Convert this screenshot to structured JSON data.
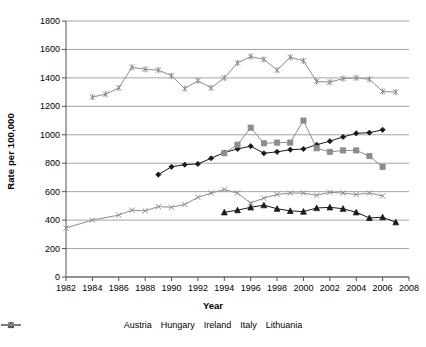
{
  "chart_data": {
    "type": "line",
    "title": "",
    "xlabel": "Year",
    "ylabel": "Rate per 100,000",
    "xlim": [
      1982,
      2008
    ],
    "ylim": [
      0,
      1800
    ],
    "ytick_step": 200,
    "xtick_step": 2,
    "grid": true,
    "legend_position": "bottom",
    "yticks": [
      "0",
      "200",
      "400",
      "600",
      "800",
      "1000",
      "1200",
      "1400",
      "1600",
      "1800"
    ],
    "xticks": [
      "1982",
      "1984",
      "1986",
      "1988",
      "1990",
      "1992",
      "1994",
      "1996",
      "1998",
      "2000",
      "2002",
      "2004",
      "2006",
      "2008"
    ],
    "series": [
      {
        "name": "Austria",
        "marker": "diamond",
        "color": "#1a1a1a",
        "points": [
          [
            1989,
            720
          ],
          [
            1990,
            775
          ],
          [
            1991,
            790
          ],
          [
            1992,
            795
          ],
          [
            1993,
            835
          ],
          [
            1994,
            875
          ],
          [
            1995,
            900
          ],
          [
            1996,
            920
          ],
          [
            1997,
            870
          ],
          [
            1998,
            880
          ],
          [
            1999,
            895
          ],
          [
            2000,
            900
          ],
          [
            2001,
            930
          ],
          [
            2002,
            955
          ],
          [
            2003,
            985
          ],
          [
            2004,
            1010
          ],
          [
            2005,
            1015
          ],
          [
            2006,
            1035
          ]
        ]
      },
      {
        "name": "Hungary",
        "marker": "square",
        "color": "#8c8c8c",
        "points": [
          [
            1994,
            870
          ],
          [
            1995,
            930
          ],
          [
            1996,
            1050
          ],
          [
            1997,
            940
          ],
          [
            1998,
            945
          ],
          [
            1999,
            945
          ],
          [
            2000,
            1100
          ],
          [
            2001,
            905
          ],
          [
            2002,
            880
          ],
          [
            2003,
            890
          ],
          [
            2004,
            890
          ],
          [
            2005,
            850
          ],
          [
            2006,
            775
          ]
        ]
      },
      {
        "name": "Ireland",
        "marker": "triangle",
        "color": "#1a1a1a",
        "points": [
          [
            1994,
            455
          ],
          [
            1995,
            470
          ],
          [
            1996,
            490
          ],
          [
            1997,
            505
          ],
          [
            1998,
            480
          ],
          [
            1999,
            465
          ],
          [
            2000,
            460
          ],
          [
            2001,
            485
          ],
          [
            2002,
            490
          ],
          [
            2003,
            480
          ],
          [
            2004,
            455
          ],
          [
            2005,
            415
          ],
          [
            2006,
            420
          ],
          [
            2007,
            385
          ]
        ]
      },
      {
        "name": "Italy",
        "marker": "cross",
        "color": "#8c8c8c",
        "points": [
          [
            1982,
            345
          ],
          [
            1984,
            400
          ],
          [
            1986,
            435
          ],
          [
            1987,
            470
          ],
          [
            1988,
            465
          ],
          [
            1989,
            495
          ],
          [
            1990,
            490
          ],
          [
            1991,
            510
          ],
          [
            1992,
            560
          ],
          [
            1993,
            590
          ],
          [
            1994,
            615
          ],
          [
            1995,
            590
          ],
          [
            1996,
            520
          ],
          [
            1997,
            555
          ],
          [
            1998,
            580
          ],
          [
            1999,
            590
          ],
          [
            2000,
            590
          ],
          [
            2001,
            575
          ],
          [
            2002,
            595
          ],
          [
            2003,
            590
          ],
          [
            2004,
            580
          ],
          [
            2005,
            590
          ],
          [
            2006,
            570
          ]
        ]
      },
      {
        "name": "Lithuania",
        "marker": "asterisk",
        "color": "#8c8c8c",
        "points": [
          [
            1984,
            1265
          ],
          [
            1985,
            1285
          ],
          [
            1986,
            1330
          ],
          [
            1987,
            1475
          ],
          [
            1988,
            1460
          ],
          [
            1989,
            1455
          ],
          [
            1990,
            1415
          ],
          [
            1991,
            1325
          ],
          [
            1992,
            1380
          ],
          [
            1993,
            1330
          ],
          [
            1994,
            1400
          ],
          [
            1995,
            1505
          ],
          [
            1996,
            1550
          ],
          [
            1997,
            1530
          ],
          [
            1998,
            1455
          ],
          [
            1999,
            1545
          ],
          [
            2000,
            1520
          ],
          [
            2001,
            1375
          ],
          [
            2002,
            1370
          ],
          [
            2003,
            1395
          ],
          [
            2004,
            1400
          ],
          [
            2005,
            1390
          ],
          [
            2006,
            1305
          ],
          [
            2007,
            1300
          ]
        ]
      }
    ]
  }
}
